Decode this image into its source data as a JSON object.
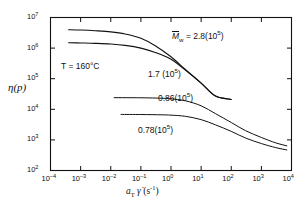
{
  "chart_data": {
    "type": "line",
    "title": "",
    "xlabel": "a_T γ̇ (s⁻¹)",
    "ylabel": "η(p)",
    "xscale": "log",
    "yscale": "log",
    "xlim": [
      0.0001,
      10000
    ],
    "ylim": [
      100,
      10000000
    ],
    "grid": false,
    "legend_position": "inline-annotations",
    "xticks": [
      "10⁻⁴",
      "10⁻³",
      "10⁻²",
      "10⁻¹",
      "10⁰",
      "10¹",
      "10²",
      "10³",
      "10⁴"
    ],
    "xtick_exponents": [
      "-4",
      "-3",
      "-2",
      "-1",
      "0",
      "1",
      "2",
      "3",
      "4"
    ],
    "yticks": [
      "10²",
      "10³",
      "10⁴",
      "10⁵",
      "10⁶",
      "10⁷"
    ],
    "ytick_exponents": [
      "2",
      "3",
      "4",
      "5",
      "6",
      "7"
    ],
    "annotations": [
      {
        "name": "temperature",
        "text": "T = 160°C",
        "x_px": 61,
        "y_px": 62
      },
      {
        "name": "mw-2.8",
        "prefix": "M",
        "sub": "w",
        "text": " = 2.8(10",
        "sup": "5",
        "suffix": ")",
        "x_px": 172,
        "y_px": 33
      },
      {
        "name": "mw-1.7",
        "text": "1.7 (10",
        "sup": "5",
        "suffix": ")",
        "x_px": 148,
        "y_px": 71
      },
      {
        "name": "mw-0.86",
        "text": "0.86(10",
        "sup": "5",
        "suffix": ")",
        "x_px": 158,
        "y_px": 96
      },
      {
        "name": "mw-0.78",
        "text": "0.78(10",
        "sup": "5",
        "suffix": ")",
        "x_px": 138,
        "y_px": 127
      }
    ],
    "series": [
      {
        "name": "Mw = 2.8(10^5)",
        "label": "2.8(10⁵)",
        "linewidth": 1.1,
        "points": [
          [
            0.0004,
            4000000
          ],
          [
            0.001,
            3900000
          ],
          [
            0.003,
            3700000
          ],
          [
            0.01,
            3400000
          ],
          [
            0.03,
            2900000
          ],
          [
            0.1,
            2100000
          ],
          [
            0.3,
            1200000
          ],
          [
            1.0,
            520000
          ],
          [
            3.0,
            200000
          ],
          [
            10.0,
            72000
          ],
          [
            30.0,
            27000
          ],
          [
            100.0,
            21000
          ]
        ]
      },
      {
        "name": "Mw = 1.7(10^5)",
        "label": "1.7 (10⁵)",
        "linewidth": 1.1,
        "points": [
          [
            0.0004,
            1500000
          ],
          [
            0.001,
            1470000
          ],
          [
            0.003,
            1430000
          ],
          [
            0.01,
            1360000
          ],
          [
            0.03,
            1230000
          ],
          [
            0.1,
            1000000
          ],
          [
            0.3,
            720000
          ],
          [
            1.0,
            430000
          ],
          [
            3.0,
            190000
          ],
          [
            10.0,
            72000
          ],
          [
            30.0,
            27000
          ],
          [
            100.0,
            21000
          ]
        ]
      },
      {
        "name": "Mw = 0.86(10^5)",
        "label": "0.86(10⁵)",
        "linewidth": 1.0,
        "points": [
          [
            0.013,
            24000
          ],
          [
            0.1,
            23800
          ],
          [
            0.5,
            23000
          ],
          [
            1.0,
            22000
          ],
          [
            3.0,
            19000
          ],
          [
            10.0,
            13000
          ],
          [
            30.0,
            7200
          ],
          [
            100.0,
            3700
          ],
          [
            300.0,
            2000
          ],
          [
            1000.0,
            1200
          ],
          [
            3000.0,
            800
          ],
          [
            7000.0,
            640
          ]
        ]
      },
      {
        "name": "Mw = 0.78(10^5)",
        "label": "0.78(10⁵)",
        "linewidth": 1.0,
        "points": [
          [
            0.022,
            6800
          ],
          [
            0.1,
            6750
          ],
          [
            0.5,
            6600
          ],
          [
            1.0,
            6450
          ],
          [
            3.0,
            5900
          ],
          [
            10.0,
            4600
          ],
          [
            30.0,
            3100
          ],
          [
            100.0,
            1900
          ],
          [
            300.0,
            1150
          ],
          [
            1000.0,
            760
          ],
          [
            3000.0,
            560
          ],
          [
            7000.0,
            470
          ]
        ]
      }
    ]
  },
  "axes": {
    "y_axis_label": "η(p)",
    "x_axis_label_base": "a",
    "x_axis_label_sub": "T",
    "x_axis_label_gamma": "γ̇",
    "x_axis_label_units": "(s",
    "x_axis_label_units_sup": "-1",
    "x_axis_label_units_close": ")"
  },
  "colors": {
    "line": "#111111",
    "axis": "#111111",
    "background": "#ffffff"
  }
}
